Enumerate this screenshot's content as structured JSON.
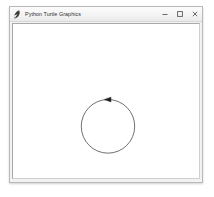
{
  "window": {
    "title": "Python Turtle Graphics",
    "icon": "python-feather-icon",
    "background_color": "#f2f2f2",
    "titlebar_color": "#f3f3f3",
    "border_color": "#b9b9b9"
  },
  "controls": {
    "minimize": {
      "label": "Minimize",
      "icon": "minimize-icon"
    },
    "maximize": {
      "label": "Maximize",
      "icon": "maximize-icon"
    },
    "close": {
      "label": "Close",
      "icon": "close-icon"
    }
  },
  "canvas": {
    "background_color": "#ffffff",
    "border_color": "#a8a8a8",
    "width": 188,
    "height": 157
  },
  "drawing": {
    "shapes": [
      {
        "name": "circle",
        "type": "circle",
        "center_x": 96,
        "center_y": 103,
        "radius": 27,
        "stroke_color": "#4a4a4a",
        "stroke_width": 0.8,
        "fill": "none"
      }
    ],
    "turtle": {
      "name": "turtle-cursor",
      "shape": "arrow",
      "x": 96,
      "y": 76,
      "heading": 0,
      "color": "#202020",
      "size": 5
    }
  }
}
